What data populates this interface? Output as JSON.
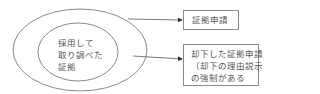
{
  "diagram": {
    "type": "nested-ellipses-with-arrows",
    "outer_ellipse": {
      "label": ""
    },
    "inner_ellipse": {
      "label_lines": [
        "採用して",
        "取り調べた",
        "証拠"
      ]
    },
    "boxes": [
      {
        "id": "box1",
        "label_lines": [
          "証拠申請"
        ]
      },
      {
        "id": "box2",
        "label_lines": [
          "却下した証拠申請",
          "（却下の理由説示",
          "の強制がある"
        ]
      }
    ],
    "arrows": [
      {
        "from": "outer_ellipse",
        "to": "box1"
      },
      {
        "from": "outer_ellipse-interior",
        "to": "box2"
      }
    ],
    "colors": {
      "stroke": "#8a8a8a",
      "text": "#555555",
      "background": "#ffffff"
    }
  }
}
